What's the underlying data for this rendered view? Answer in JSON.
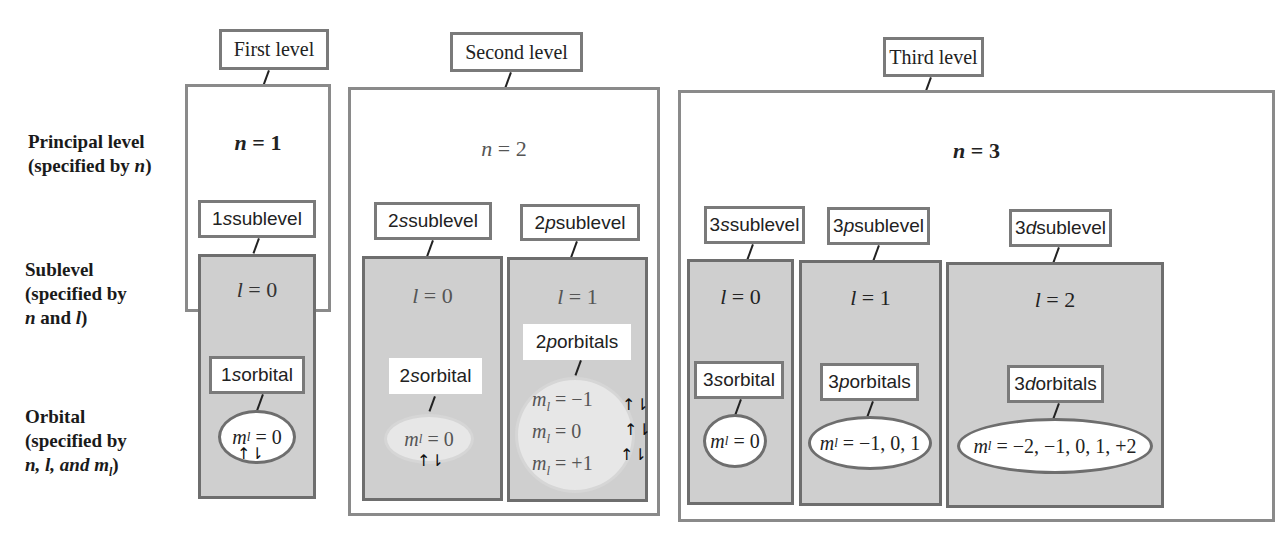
{
  "row_labels": {
    "principal": {
      "line1": "Principal level",
      "line2_prefix": "(specified by ",
      "line2_var": "n",
      "line2_suffix": ")"
    },
    "sublevel": {
      "line1": "Sublevel",
      "line2": "(specified by",
      "line3_var": "n",
      "line3_mid": " and ",
      "line3_var2": "l",
      "line3_suffix": ")"
    },
    "orbital": {
      "line1": "Orbital",
      "line2": "(specified by",
      "line3": "n, l, and m",
      "line3_sub": "l",
      "line3_suffix": ")"
    }
  },
  "levels": [
    {
      "title": "First level",
      "n_var": "n",
      "n_eq": " = 1",
      "sublevels": [
        {
          "label_num": "1",
          "label_letter": "s",
          "label_rest": " sublevel",
          "l_var": "l",
          "l_eq": " = 0",
          "orbital_num": "1",
          "orbital_letter": "s",
          "orbital_rest": " orbital",
          "ml": "= 0"
        }
      ]
    },
    {
      "title": "Second level",
      "n_var": "n",
      "n_eq": " = 2",
      "sublevels": [
        {
          "label_num": "2",
          "label_letter": "s",
          "label_rest": " sublevel",
          "l_var": "l",
          "l_eq": " = 0",
          "orbital_num": "2",
          "orbital_letter": "s",
          "orbital_rest": " orbital",
          "ml": "= 0"
        },
        {
          "label_num": "2",
          "label_letter": "p",
          "label_rest": " sublevel",
          "l_var": "l",
          "l_eq": " = 1",
          "orbital_num": "2",
          "orbital_letter": "p",
          "orbital_rest": " orbitals",
          "ml_lines": [
            "= −1",
            "= 0",
            "= +1"
          ]
        }
      ]
    },
    {
      "title": "Third level",
      "n_var": "n",
      "n_eq": " = 3",
      "sublevels": [
        {
          "label_num": "3",
          "label_letter": "s",
          "label_rest": " sublevel",
          "l_var": "l",
          "l_eq": " = 0",
          "orbital_num": "3",
          "orbital_letter": "s",
          "orbital_rest": " orbital",
          "ml": "= 0"
        },
        {
          "label_num": "3",
          "label_letter": "p",
          "label_rest": " sublevel",
          "l_var": "l",
          "l_eq": " = 1",
          "orbital_num": "3",
          "orbital_letter": "p",
          "orbital_rest": " orbitals",
          "ml": "= −1, 0, 1"
        },
        {
          "label_num": "3",
          "label_letter": "d",
          "label_rest": " sublevel",
          "l_var": "l",
          "l_eq": " = 2",
          "orbital_num": "3",
          "orbital_letter": "d",
          "orbital_rest": " orbitals",
          "ml": "= −2, −1, 0, 1, +2"
        }
      ]
    }
  ],
  "symbols": {
    "m": "m",
    "l_sub": "l",
    "spin_pair": "↑⇂"
  },
  "colors": {
    "sublevel_fill": "#cfcfcf",
    "border": "#7a7a7a"
  }
}
